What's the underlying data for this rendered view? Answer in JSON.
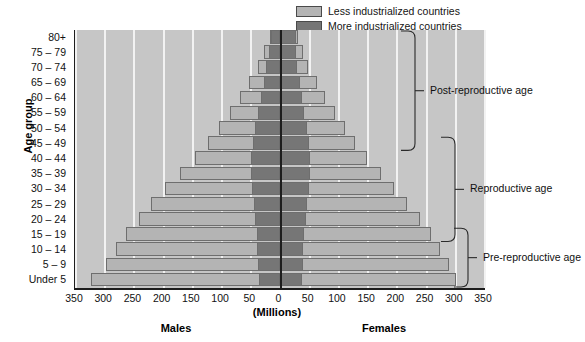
{
  "legend": {
    "items": [
      {
        "label": "Less industrialized countries",
        "color": "#b4b4b4",
        "key": "less"
      },
      {
        "label": "More industrialized countries",
        "color": "#767676",
        "key": "more"
      }
    ]
  },
  "axes": {
    "y_title": "Age group",
    "x_units": "(Millions)",
    "left_side_label": "Males",
    "right_side_label": "Females",
    "x_ticks": [
      "350",
      "300",
      "250",
      "200",
      "150",
      "100",
      "50",
      "0",
      "50",
      "100",
      "150",
      "200",
      "250",
      "300",
      "350"
    ],
    "x_tick_values": [
      -350,
      -300,
      -250,
      -200,
      -150,
      -100,
      -50,
      0,
      50,
      100,
      150,
      200,
      250,
      300,
      350
    ],
    "xlim": [
      -350,
      350
    ],
    "grid": true
  },
  "annotations": [
    {
      "label": "Post-reproductive age",
      "from_group": "80+",
      "to_group": "45 – 49"
    },
    {
      "label": "Reproductive age",
      "from_group": "45 – 49",
      "to_group": "15 – 19"
    },
    {
      "label": "Pre-reproductive age",
      "from_group": "15 – 19",
      "to_group": "Under 5"
    }
  ],
  "chart_data": {
    "type": "bar",
    "title": "",
    "subtitle": "",
    "xlabel": "(Millions)",
    "ylabel": "Age group",
    "xlim": [
      -350,
      350
    ],
    "grid": true,
    "legend_position": "top-center",
    "orientation": "population-pyramid",
    "categories": [
      "80+",
      "75 – 79",
      "70 – 74",
      "65 – 69",
      "60 – 64",
      "55 – 59",
      "50 – 54",
      "45 – 49",
      "40 – 44",
      "35 – 39",
      "30 – 34",
      "25 – 29",
      "20 – 24",
      "15 – 19",
      "10 – 14",
      "5 – 9",
      "Under 5"
    ],
    "series": [
      {
        "name": "Males — More industrialized countries",
        "side": "left",
        "fill": "more",
        "values": [
          16,
          19,
          24,
          29,
          34,
          38,
          43,
          47,
          50,
          50,
          48,
          46,
          43,
          41,
          40,
          39,
          37
        ]
      },
      {
        "name": "Males — Less industrialized countries",
        "side": "left",
        "fill": "less",
        "values": [
          18,
          28,
          39,
          54,
          70,
          87,
          105,
          124,
          146,
          172,
          197,
          221,
          243,
          264,
          282,
          298,
          324
        ]
      },
      {
        "name": "Females — More industrialized countries",
        "side": "right",
        "fill": "more",
        "values": [
          26,
          26,
          29,
          33,
          37,
          41,
          45,
          48,
          50,
          50,
          48,
          46,
          43,
          41,
          39,
          38,
          36
        ]
      },
      {
        "name": "Females — Less industrialized countries",
        "side": "right",
        "fill": "less",
        "values": [
          30,
          38,
          47,
          62,
          77,
          93,
          110,
          128,
          148,
          172,
          195,
          217,
          238,
          257,
          273,
          288,
          300
        ]
      }
    ],
    "notes": [
      "Left half of the pyramid is Males, right half is Females.",
      "Each bar is split: a dark inner segment for more industrialized countries and a light outer segment for less industrialized countries.",
      "Values are cumulative bar ends in millions read off the 50-million gridlines."
    ]
  }
}
